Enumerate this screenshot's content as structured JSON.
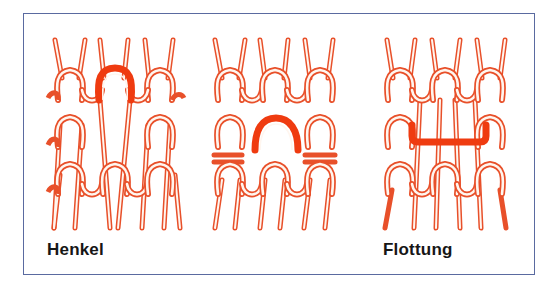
{
  "figure": {
    "panels": [
      {
        "id": "tuck",
        "label": "Henkel",
        "highlight": "tuck-loop-arch"
      },
      {
        "id": "middle",
        "label": "",
        "highlight": "held-loop-arch"
      },
      {
        "id": "float",
        "label": "Flottung",
        "highlight": "float-bar"
      }
    ],
    "colors": {
      "yarn": "#e8502a",
      "yarn_fill": "#fff6ef",
      "highlight": "#ef3b10",
      "frame": "#5a6aa0",
      "label": "#161616",
      "background": "#ffffff"
    }
  }
}
